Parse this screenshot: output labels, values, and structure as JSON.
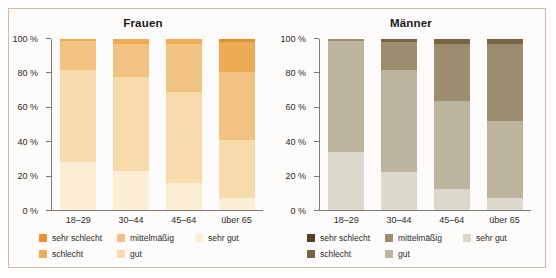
{
  "figure": {
    "border_color": "#dbb6a8",
    "background": "#fdfcfa"
  },
  "panels": [
    {
      "id": "frauen",
      "title": "Frauen",
      "palette": {
        "sehr_schlecht": "#e8902d",
        "schlecht": "#eeab55",
        "mittelmaessig": "#f2c281",
        "gut": "#f7dbad",
        "sehr_gut": "#fbeed4"
      }
    },
    {
      "id": "maenner",
      "title": "Männer",
      "palette": {
        "sehr_schlecht": "#554026",
        "schlecht": "#776445",
        "mittelmaessig": "#9c8d6e",
        "gut": "#bdb49e",
        "sehr_gut": "#dcd8cb"
      }
    }
  ],
  "axis": {
    "ticks": [
      "100 %",
      "80 %",
      "60 %",
      "40 %",
      "20 %",
      "0 %"
    ],
    "tick_values": [
      100,
      80,
      60,
      40,
      20,
      0
    ],
    "min": 0,
    "max": 100
  },
  "legend": {
    "entries": [
      {
        "key": "sehr_schlecht",
        "label": "sehr schlecht",
        "col": 1,
        "row": 1
      },
      {
        "key": "mittelmaessig",
        "label": "mittelmäßig",
        "col": 2,
        "row": 1
      },
      {
        "key": "sehr_gut",
        "label": "sehr gut",
        "col": 3,
        "row": 1
      },
      {
        "key": "schlecht",
        "label": "schlecht",
        "col": 1,
        "row": 2
      },
      {
        "key": "gut",
        "label": "gut",
        "col": 2,
        "row": 2
      }
    ]
  },
  "chart_data": [
    {
      "type": "bar",
      "subtype": "stacked-100-percent",
      "title": "Frauen",
      "xlabel": "",
      "ylabel": "",
      "ylim": [
        0,
        100
      ],
      "yticks": [
        0,
        20,
        40,
        60,
        80,
        100
      ],
      "ytick_labels": [
        "0 %",
        "20 %",
        "40 %",
        "60 %",
        "80 %",
        "100 %"
      ],
      "grid": false,
      "legend_position": "bottom",
      "categories": [
        "18–29",
        "30–44",
        "45–64",
        "über 65"
      ],
      "series": [
        {
          "name": "sehr gut",
          "color": "#fbeed4",
          "values": [
            28,
            23,
            16,
            7
          ]
        },
        {
          "name": "gut",
          "color": "#f7dbad",
          "values": [
            54,
            55,
            53,
            34
          ]
        },
        {
          "name": "mittelmäßig",
          "color": "#f2c281",
          "values": [
            17,
            19,
            28,
            40
          ]
        },
        {
          "name": "schlecht",
          "color": "#eeab55",
          "values": [
            1,
            3,
            3,
            17
          ]
        },
        {
          "name": "sehr schlecht",
          "color": "#e8902d",
          "values": [
            0,
            0,
            0,
            2
          ]
        }
      ]
    },
    {
      "type": "bar",
      "subtype": "stacked-100-percent",
      "title": "Männer",
      "xlabel": "",
      "ylabel": "",
      "ylim": [
        0,
        100
      ],
      "yticks": [
        0,
        20,
        40,
        60,
        80,
        100
      ],
      "ytick_labels": [
        "0 %",
        "20 %",
        "40 %",
        "60 %",
        "80 %",
        "100 %"
      ],
      "grid": false,
      "legend_position": "bottom",
      "categories": [
        "18–29",
        "30–44",
        "45–64",
        "über 65"
      ],
      "series": [
        {
          "name": "sehr gut",
          "color": "#dcd8cb",
          "values": [
            34,
            22,
            12,
            7
          ]
        },
        {
          "name": "gut",
          "color": "#bdb49e",
          "values": [
            65,
            60,
            52,
            45
          ]
        },
        {
          "name": "mittelmäßig",
          "color": "#9c8d6e",
          "values": [
            1,
            16,
            33,
            45
          ]
        },
        {
          "name": "schlecht",
          "color": "#776445",
          "values": [
            0,
            2,
            3,
            3
          ]
        },
        {
          "name": "sehr schlecht",
          "color": "#554026",
          "values": [
            0,
            0,
            0,
            0
          ]
        }
      ]
    }
  ]
}
